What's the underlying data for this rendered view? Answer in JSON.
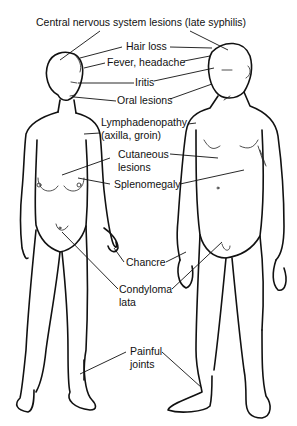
{
  "diagram": {
    "figures": [
      "female-figure",
      "male-figure"
    ],
    "labels": {
      "cns": "Central nervous system lesions (late syphilis)",
      "hair_loss": "Hair loss",
      "fever": "Fever, headache",
      "iritis": "Iritis",
      "oral": "Oral lesions",
      "lymph_1": "Lymphadenopathy",
      "lymph_2": "(axilla, groin)",
      "cutaneous_1": "Cutaneous",
      "cutaneous_2": "lesions",
      "spleno": "Splenomegaly",
      "chancre": "Chancre",
      "condyloma_1": "Condyloma",
      "condyloma_2": "lata",
      "joints_1": "Painful",
      "joints_2": "joints"
    }
  }
}
